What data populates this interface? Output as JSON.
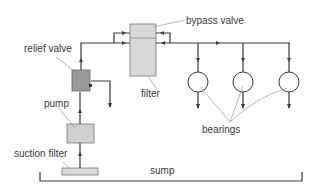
{
  "diagram": {
    "type": "lubrication-system-schematic",
    "labels": {
      "bypass_valve": "bypass valve",
      "relief_valve": "relief valve",
      "filter": "filter",
      "pump": "pump",
      "suction_filter": "suction filter",
      "bearings": "bearings",
      "sump": "sump"
    },
    "components": [
      {
        "id": "suction_filter",
        "label": "suction filter"
      },
      {
        "id": "pump",
        "label": "pump"
      },
      {
        "id": "relief_valve",
        "label": "relief valve"
      },
      {
        "id": "filter",
        "label": "filter"
      },
      {
        "id": "bypass_valve",
        "label": "bypass valve"
      },
      {
        "id": "bearing_1",
        "label": "bearings"
      },
      {
        "id": "bearing_2",
        "label": "bearings"
      },
      {
        "id": "bearing_3",
        "label": "bearings"
      },
      {
        "id": "sump",
        "label": "sump"
      }
    ],
    "colors": {
      "line": "#3a3a3a",
      "box_light": "#d9d9d9",
      "box_dark": "#9a9a9a",
      "leader": "#888888"
    }
  }
}
